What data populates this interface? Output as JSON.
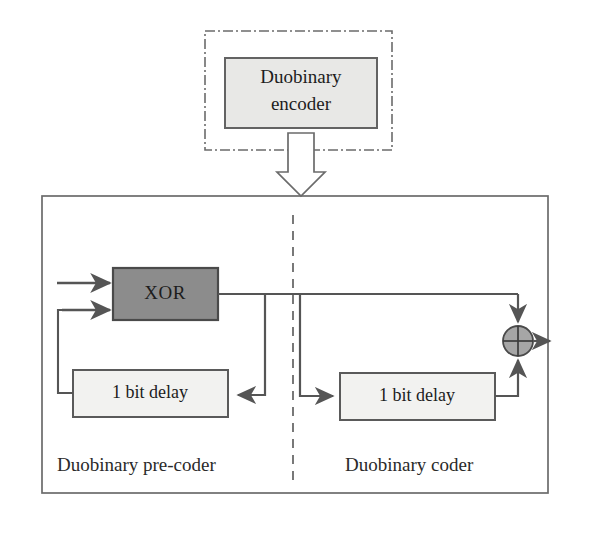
{
  "figure": {
    "colors": {
      "xor_fill": "#8c8c8c",
      "block_fill": "#e8e8e6",
      "sum_fill": "#a6a6a6",
      "stroke": "#555555",
      "frame_stroke": "#6b6b6b",
      "text": "#1d1d1d",
      "background": "#ffffff"
    }
  },
  "top_group": {
    "border_style": "dash-dot",
    "encoder_block": {
      "line1": "Duobinary",
      "line2": "encoder"
    },
    "connector": {
      "name": "block-arrow-down",
      "direction": "down"
    }
  },
  "main_frame": {
    "divider_style": "dashed",
    "left_section": {
      "label": "Duobinary pre-coder",
      "blocks": {
        "xor": "XOR",
        "delay": "1 bit delay"
      },
      "inputs": [
        {
          "name": "input-arrow-top"
        },
        {
          "name": "input-arrow-bottom"
        }
      ]
    },
    "right_section": {
      "label": "Duobinary coder",
      "blocks": {
        "delay": "1 bit delay"
      },
      "summing_junction": {
        "name": "summing-junction",
        "symbol": "crosshair"
      },
      "output": {
        "name": "output-arrow"
      }
    }
  }
}
